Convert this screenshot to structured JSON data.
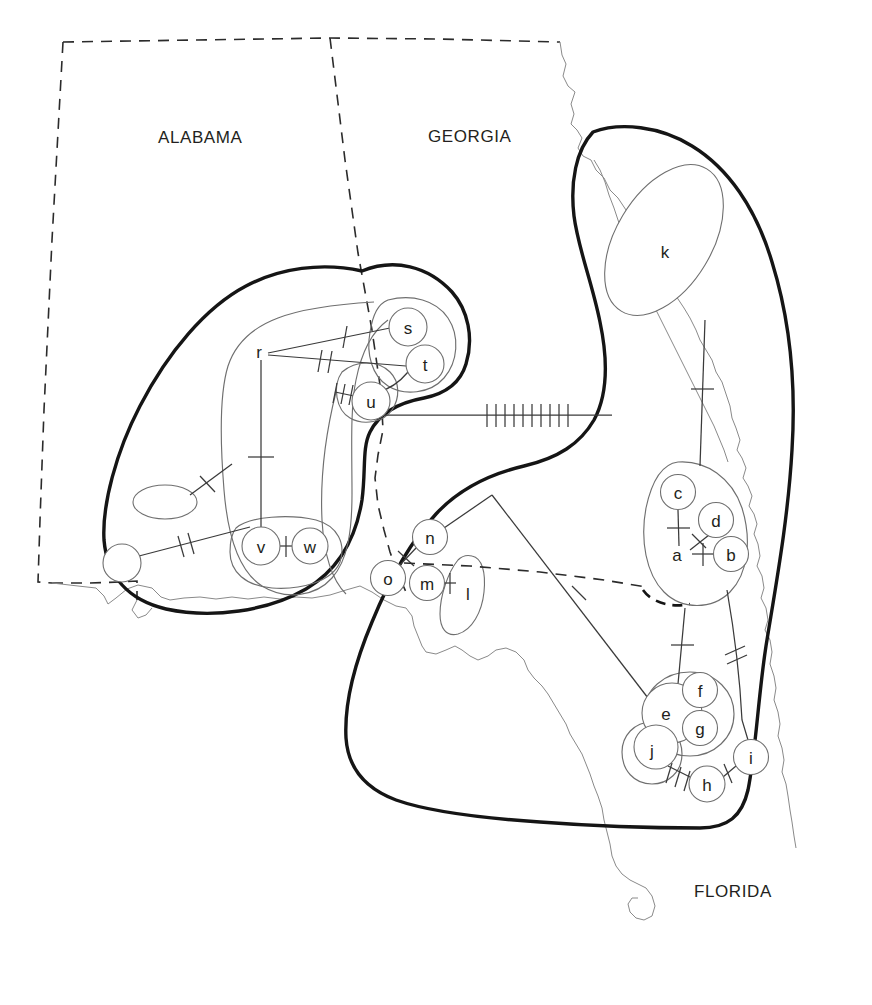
{
  "figure": {
    "type": "haplotype-network-geographic-map",
    "background_color": "#ffffff",
    "ink_color": "#231f20",
    "clade_color": "#151515",
    "outline_color": "#6f6f6f",
    "coast_color": "#8a8a8a",
    "width": 872,
    "height": 1005
  },
  "state_labels": [
    {
      "name": "alabama",
      "text": "ALABAMA",
      "x": 158,
      "y": 143
    },
    {
      "name": "georgia",
      "text": "GEORGIA",
      "x": 428,
      "y": 142
    },
    {
      "name": "florida",
      "text": "FLORIDA",
      "x": 694,
      "y": 897
    }
  ],
  "nodes": [
    {
      "id": "a",
      "label": "a",
      "x": 683,
      "y": 554,
      "r": 0,
      "shape": "none"
    },
    {
      "id": "b",
      "label": "b",
      "x": 731,
      "y": 554,
      "r": 17.5,
      "shape": "circle"
    },
    {
      "id": "c",
      "label": "c",
      "x": 678,
      "y": 492,
      "r": 17.5,
      "shape": "circle"
    },
    {
      "id": "d",
      "label": "d",
      "x": 716,
      "y": 520,
      "r": 17.5,
      "shape": "circle"
    },
    {
      "id": "e",
      "label": "e",
      "x": 672,
      "y": 713,
      "r": 30.0,
      "shape": "circle"
    },
    {
      "id": "f",
      "label": "f",
      "x": 700,
      "y": 690,
      "r": 17.5,
      "shape": "circle"
    },
    {
      "id": "g",
      "label": "g",
      "x": 700,
      "y": 728,
      "r": 17.5,
      "shape": "circle"
    },
    {
      "id": "h",
      "label": "h",
      "x": 707,
      "y": 784,
      "r": 18.0,
      "shape": "circle"
    },
    {
      "id": "i",
      "label": "i",
      "x": 751,
      "y": 757,
      "r": 17.5,
      "shape": "circle"
    },
    {
      "id": "j",
      "label": "j",
      "x": 656,
      "y": 747,
      "r": 22.0,
      "shape": "circle"
    },
    {
      "id": "k",
      "label": "k",
      "x": 665,
      "y": 252,
      "r": 0,
      "shape": "lake"
    },
    {
      "id": "l",
      "label": "l",
      "x": 468,
      "y": 594,
      "r": 0,
      "shape": "lake"
    },
    {
      "id": "m",
      "label": "m",
      "x": 427,
      "y": 583,
      "r": 17.5,
      "shape": "circle"
    },
    {
      "id": "n",
      "label": "n",
      "x": 430,
      "y": 537,
      "r": 17.5,
      "shape": "circle"
    },
    {
      "id": "o",
      "label": "o",
      "x": 388,
      "y": 578,
      "r": 17.5,
      "shape": "circle"
    },
    {
      "id": "p",
      "label": "p",
      "x": 259,
      "y": 352,
      "r": 0,
      "shape": "none"
    },
    {
      "id": "q",
      "label": "q",
      "x": 408,
      "y": 327,
      "r": 19.0,
      "shape": "circle"
    },
    {
      "id": "r",
      "label": "r",
      "x": 425,
      "y": 364,
      "r": 19.0,
      "shape": "circle"
    },
    {
      "id": "s",
      "label": "s",
      "x": 371,
      "y": 401,
      "r": 19.0,
      "shape": "circle"
    },
    {
      "id": "t",
      "label": "t",
      "x": 261,
      "y": 546,
      "r": 19.0,
      "shape": "circle"
    },
    {
      "id": "u",
      "label": "u",
      "x": 310,
      "y": 546,
      "r": 18.0,
      "shape": "circle"
    },
    {
      "id": "v",
      "label": "v",
      "x": 122,
      "y": 563,
      "r": 19.0,
      "shape": "circle"
    },
    {
      "id": "w",
      "label": "w",
      "x": 165,
      "y": 502,
      "r": 0,
      "shape": "ellipse"
    }
  ],
  "edges": [
    {
      "from": "p",
      "to": "q",
      "ticks": 1,
      "style": "solid"
    },
    {
      "from": "p",
      "to": "r",
      "ticks": 2,
      "style": "solid"
    },
    {
      "from": "r",
      "to": "s",
      "ticks": 0,
      "style": "solid"
    },
    {
      "from": "s",
      "to": "blob-left",
      "ticks": 3,
      "style": "solid"
    },
    {
      "from": "p",
      "to": "t",
      "ticks": 1,
      "style": "solid"
    },
    {
      "from": "t",
      "to": "u",
      "ticks": 1,
      "style": "solid"
    },
    {
      "from": "v",
      "to": "u-group",
      "ticks": 2,
      "style": "solid"
    },
    {
      "from": "w",
      "to": "t-blob",
      "ticks": 1,
      "style": "solid"
    },
    {
      "from": "s-group",
      "to": "k-stem",
      "ticks": 10,
      "style": "solid"
    },
    {
      "from": "k",
      "to": "c",
      "ticks": 1,
      "style": "solid"
    },
    {
      "from": "c",
      "to": "a",
      "ticks": 1,
      "style": "solid"
    },
    {
      "from": "a",
      "to": "b",
      "ticks": 1,
      "style": "solid"
    },
    {
      "from": "d",
      "to": "a",
      "ticks": 1,
      "style": "solid"
    },
    {
      "from": "a",
      "to": "e",
      "ticks": 1,
      "style": "solid"
    },
    {
      "from": "b",
      "to": "i",
      "ticks": 2,
      "style": "solid"
    },
    {
      "from": "j",
      "to": "h",
      "ticks": 3,
      "style": "solid"
    },
    {
      "from": "h",
      "to": "i",
      "ticks": 1,
      "style": "solid"
    },
    {
      "from": "m",
      "to": "l",
      "ticks": 1,
      "style": "solid"
    },
    {
      "from": "n",
      "to": "peak",
      "ticks": 0,
      "style": "solid"
    },
    {
      "from": "peak",
      "to": "e",
      "ticks": 1,
      "style": "solid"
    },
    {
      "from": "n",
      "to": "o",
      "ticks": 1,
      "style": "solid"
    }
  ],
  "clades": [
    {
      "name": "western-clade",
      "style": "thick-solid"
    },
    {
      "name": "eastern-clade",
      "style": "thick-solid"
    },
    {
      "name": "southern-clade",
      "style": "thick-solid"
    }
  ],
  "boundaries": {
    "state_line_style": "dashed",
    "coastline_style": "thin-solid",
    "haplogroup_dashed_style": "dashed"
  }
}
